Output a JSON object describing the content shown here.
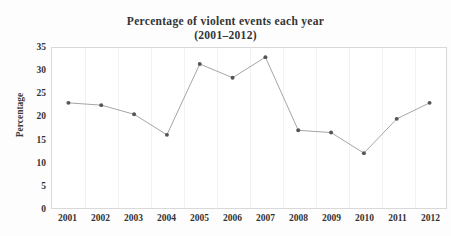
{
  "chart_data": {
    "type": "line",
    "title": "Percentage of violent events each year",
    "subtitle": "(2001–2012)",
    "xlabel": "",
    "ylabel": "Percentage",
    "categories": [
      "2001",
      "2002",
      "2003",
      "2004",
      "2005",
      "2006",
      "2007",
      "2008",
      "2009",
      "2010",
      "2011",
      "2012"
    ],
    "values": [
      23,
      22.5,
      20.5,
      16,
      31.5,
      28.5,
      33,
      17,
      16.5,
      12,
      19.5,
      23
    ],
    "ylim": [
      0,
      35
    ],
    "ytick_labels": [
      "0",
      "5",
      "10",
      "15",
      "20",
      "25",
      "30",
      "35"
    ],
    "ytick_values": [
      0,
      5,
      10,
      15,
      20,
      25,
      30,
      35
    ],
    "grid": "vertical-only",
    "legend": "none",
    "series": [
      {
        "name": "Percentage of violent events",
        "values": [
          23,
          22.5,
          20.5,
          16,
          31.5,
          28.5,
          33,
          17,
          16.5,
          12,
          19.5,
          23
        ],
        "line_color": "#9a9a9a",
        "marker_color": "#555555",
        "marker": "circle"
      }
    ]
  },
  "style": {
    "plot_background": "#ffffff",
    "frame_color": "#d9d9d9",
    "gridline_color": "#f2f2f2",
    "text_color": "#333333"
  }
}
